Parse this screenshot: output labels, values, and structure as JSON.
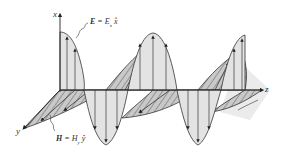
{
  "figure": {
    "type": "electromagnetic-plane-wave",
    "axes": {
      "x": "x",
      "y": "y",
      "z": "z"
    },
    "labels": {
      "electric_field": "E = E_x x̂",
      "electric_field_symbol": "E",
      "electric_field_rhs": "= E",
      "electric_field_sub": "x",
      "electric_field_unit": "x̂",
      "magnetic_field": "H = H_y ŷ",
      "magnetic_field_symbol": "H",
      "magnetic_field_rhs": "= H",
      "magnetic_field_sub": "y",
      "magnetic_field_unit": "ŷ"
    },
    "colors": {
      "line": "#333333",
      "e_fill": "#e2e2e2",
      "h_fill": "#c8c8c8",
      "hatch": "#555555",
      "shadow": "#dcdcdc"
    }
  }
}
